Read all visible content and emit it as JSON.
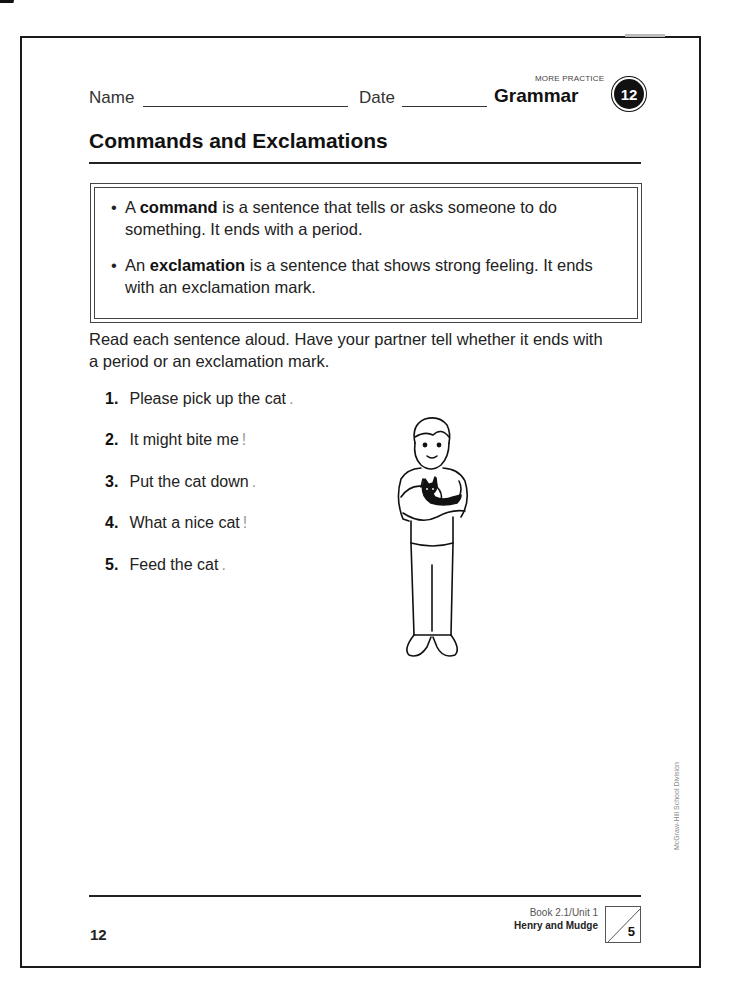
{
  "header": {
    "name_label": "Name",
    "date_label": "Date",
    "more_practice": "MORE PRACTICE",
    "subject": "Grammar",
    "lesson_number": "12"
  },
  "title": "Commands and Exclamations",
  "rules": [
    {
      "prefix": "A ",
      "term": "command",
      "rest": " is a sentence that tells or asks someone to do something. It ends with a period."
    },
    {
      "prefix": "An ",
      "term": "exclamation",
      "rest": " is a sentence that shows strong feeling. It ends with an exclamation mark."
    }
  ],
  "instructions": "Read each sentence aloud. Have your partner tell whether it ends with a period or an exclamation mark.",
  "items": [
    {
      "num": "1.",
      "text": "Please pick up the cat",
      "answer": "."
    },
    {
      "num": "2.",
      "text": "It might bite me",
      "answer": "!"
    },
    {
      "num": "3.",
      "text": "Put the cat down",
      "answer": "."
    },
    {
      "num": "4.",
      "text": "What a nice cat",
      "answer": "!"
    },
    {
      "num": "5.",
      "text": "Feed the cat",
      "answer": "."
    }
  ],
  "illustration": {
    "icon": "boy-holding-cat-illustration"
  },
  "credit": "McGraw-Hill School Division",
  "footer": {
    "page_number": "12",
    "book_unit": "Book 2.1/Unit 1",
    "story_title": "Henry and Mudge",
    "score_total": "5"
  }
}
